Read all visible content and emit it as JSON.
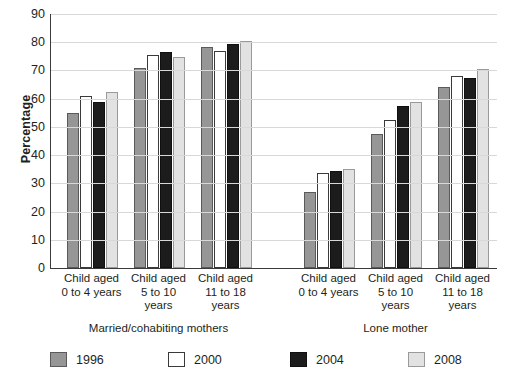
{
  "chart_data": {
    "type": "bar",
    "title": "",
    "subtitle": "",
    "xlabel": "",
    "ylabel": "Percentage",
    "ylim": [
      0,
      90
    ],
    "ytick_step": 10,
    "yticks": [
      0,
      10,
      20,
      30,
      40,
      50,
      60,
      70,
      80,
      90
    ],
    "ytick_labels": [
      "0",
      "10",
      "20",
      "30",
      "40",
      "50",
      "60",
      "70",
      "80",
      "90"
    ],
    "grid": "horizontal",
    "legend_position": "bottom",
    "categories": [
      "Child aged 0 to 4 years",
      "Child aged 5 to 10 years",
      "Child aged 11 to 18 years",
      "Child aged 0 to 4 years",
      "Child aged 5 to 10 years",
      "Child aged 11 to 18 years"
    ],
    "category_lines": [
      [
        "Child aged",
        "0 to 4 years"
      ],
      [
        "Child aged",
        "5 to 10",
        "years"
      ],
      [
        "Child aged",
        "11 to 18",
        "years"
      ],
      [
        "Child aged",
        "0 to 4 years"
      ],
      [
        "Child aged",
        "5 to 10",
        "years"
      ],
      [
        "Child aged",
        "11 to 18",
        "years"
      ]
    ],
    "group_labels": [
      "Married/cohabiting mothers",
      "Lone mother"
    ],
    "series": [
      {
        "name": "1996",
        "color": "#969696",
        "border": "#5a5a5a",
        "values": [
          55.0,
          71.0,
          78.3,
          27.0,
          47.5,
          64.3
        ]
      },
      {
        "name": "2000",
        "color": "#ffffff",
        "border": "#3a3a3a",
        "values": [
          61.0,
          75.5,
          77.0,
          33.8,
          52.3,
          68.0
        ]
      },
      {
        "name": "2004",
        "color": "#1c1c1c",
        "border": "#101010",
        "values": [
          58.7,
          76.5,
          79.3,
          34.3,
          57.5,
          67.3
        ]
      },
      {
        "name": "2008",
        "color": "#e2e2e2",
        "border": "#9a9a9a",
        "values": [
          62.5,
          74.7,
          80.5,
          35.2,
          59.0,
          70.5
        ]
      }
    ]
  }
}
